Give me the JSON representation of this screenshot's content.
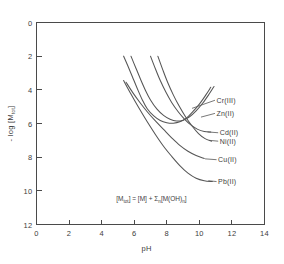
{
  "chart_data": {
    "type": "line",
    "title": "",
    "subtitle": "",
    "xlabel": "pH",
    "ylabel": "- log [M tot]",
    "ylabel_parts": {
      "prefix": "- log [M",
      "subscript": "tot",
      "suffix": "]"
    },
    "xlim": [
      0,
      14
    ],
    "ylim": [
      0,
      12
    ],
    "y_inverted": true,
    "grid": false,
    "legend_position": "inline-right-labels",
    "xticks": [
      0,
      2,
      4,
      6,
      8,
      10,
      12,
      14
    ],
    "xtick_labels": [
      "0",
      "2",
      "4",
      "6",
      "8",
      "10",
      "12",
      "14"
    ],
    "yticks": [
      0,
      2,
      4,
      6,
      8,
      10,
      12
    ],
    "ytick_labels": [
      "0",
      "2",
      "4",
      "6",
      "8",
      "10",
      "12"
    ],
    "annotation": {
      "text": "[M tot] = [M] + Sum n [M(OH) n]",
      "x": 4.9,
      "y": 10.6,
      "parts": {
        "a": "[M",
        "a_sub": "tot",
        "b": "] = [M] + ",
        "sigma": "Σ",
        "sigma_sub": "n",
        "c": "[M(OH)",
        "c_sub": "n",
        "d": "]"
      }
    },
    "series": [
      {
        "name": "Cr(III)",
        "label": "Cr(III)",
        "label_x": 11.05,
        "label_y": 4.62,
        "leader_from": [
          9.55,
          5.1
        ],
        "points": [
          [
            5.35,
            2.0
          ],
          [
            5.6,
            2.55
          ],
          [
            5.9,
            3.25
          ],
          [
            6.2,
            3.95
          ],
          [
            6.5,
            4.6
          ],
          [
            6.8,
            5.12
          ],
          [
            7.2,
            5.55
          ],
          [
            7.6,
            5.82
          ],
          [
            8.0,
            5.95
          ],
          [
            8.4,
            5.98
          ],
          [
            8.8,
            5.9
          ],
          [
            9.2,
            5.68
          ],
          [
            9.6,
            5.3
          ],
          [
            10.0,
            4.85
          ],
          [
            10.4,
            4.3
          ],
          [
            10.7,
            3.85
          ]
        ]
      },
      {
        "name": "Zn(II)",
        "label": "Zn(II)",
        "label_x": 11.05,
        "label_y": 5.4,
        "leader_from": [
          10.1,
          5.62
        ],
        "points": [
          [
            5.8,
            2.0
          ],
          [
            6.1,
            2.7
          ],
          [
            6.4,
            3.4
          ],
          [
            6.7,
            4.05
          ],
          [
            7.0,
            4.6
          ],
          [
            7.4,
            5.15
          ],
          [
            7.8,
            5.52
          ],
          [
            8.2,
            5.75
          ],
          [
            8.6,
            5.85
          ],
          [
            9.0,
            5.8
          ],
          [
            9.4,
            5.6
          ],
          [
            9.8,
            5.25
          ],
          [
            10.2,
            4.8
          ],
          [
            10.6,
            4.25
          ],
          [
            10.9,
            3.8
          ]
        ]
      },
      {
        "name": "Cd(II)",
        "label": "Cd(II)",
        "label_x": 11.25,
        "label_y": 6.55,
        "leader_from": [
          10.5,
          6.5
        ],
        "points": [
          [
            7.0,
            2.0
          ],
          [
            7.3,
            2.75
          ],
          [
            7.6,
            3.45
          ],
          [
            7.95,
            4.15
          ],
          [
            8.3,
            4.75
          ],
          [
            8.7,
            5.3
          ],
          [
            9.1,
            5.75
          ],
          [
            9.5,
            6.1
          ],
          [
            9.9,
            6.35
          ],
          [
            10.3,
            6.48
          ],
          [
            10.7,
            6.5
          ]
        ]
      },
      {
        "name": "Ni(II)",
        "label": "Ni(II)",
        "label_x": 11.25,
        "label_y": 7.05,
        "leader_from": [
          10.6,
          7.0
        ],
        "points": [
          [
            7.45,
            2.0
          ],
          [
            7.75,
            2.8
          ],
          [
            8.05,
            3.55
          ],
          [
            8.4,
            4.3
          ],
          [
            8.75,
            4.95
          ],
          [
            9.15,
            5.6
          ],
          [
            9.55,
            6.15
          ],
          [
            9.95,
            6.6
          ],
          [
            10.35,
            6.9
          ],
          [
            10.75,
            7.05
          ]
        ]
      },
      {
        "name": "Cu(II)",
        "label": "Cu(II)",
        "label_x": 11.15,
        "label_y": 8.15,
        "leader_from": [
          10.35,
          8.1
        ],
        "points": [
          [
            5.5,
            3.55
          ],
          [
            5.9,
            4.15
          ],
          [
            6.35,
            4.75
          ],
          [
            6.8,
            5.3
          ],
          [
            7.3,
            5.85
          ],
          [
            7.8,
            6.35
          ],
          [
            8.3,
            6.85
          ],
          [
            8.8,
            7.3
          ],
          [
            9.3,
            7.65
          ],
          [
            9.8,
            7.9
          ],
          [
            10.3,
            8.08
          ]
        ]
      },
      {
        "name": "Pb(II)",
        "label": "Pb(II)",
        "label_x": 11.15,
        "label_y": 9.45,
        "leader_from": [
          10.55,
          9.4
        ],
        "points": [
          [
            5.35,
            3.45
          ],
          [
            5.8,
            4.25
          ],
          [
            6.3,
            5.1
          ],
          [
            6.8,
            5.9
          ],
          [
            7.3,
            6.65
          ],
          [
            7.8,
            7.35
          ],
          [
            8.3,
            7.95
          ],
          [
            8.8,
            8.5
          ],
          [
            9.3,
            8.95
          ],
          [
            9.8,
            9.25
          ],
          [
            10.3,
            9.4
          ],
          [
            10.8,
            9.45
          ]
        ]
      }
    ]
  },
  "colors": {
    "background": "#ffffff",
    "axis": "#4a4a4a",
    "curve": "#555555",
    "text": "#3d3d3d"
  }
}
